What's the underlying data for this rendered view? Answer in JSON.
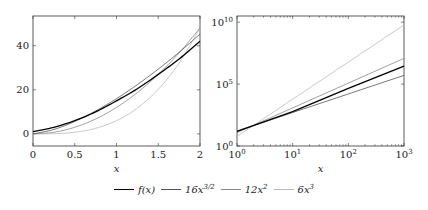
{
  "chart_data": [
    {
      "type": "line",
      "title": "",
      "xlabel": "x",
      "ylabel": "",
      "xscale": "linear",
      "yscale": "linear",
      "xlim": [
        0,
        2
      ],
      "ylim": [
        -5.5,
        53.5
      ],
      "xticks": [
        0,
        0.5,
        1,
        1.5,
        2
      ],
      "xtick_labels": [
        "0",
        "0.5",
        "1",
        "1.5",
        "2"
      ],
      "yticks": [
        0,
        20,
        40
      ],
      "ytick_labels": [
        "0",
        "20",
        "40"
      ],
      "grid": false,
      "x": [
        0,
        0.25,
        0.5,
        0.75,
        1,
        1.25,
        1.5,
        1.75,
        2
      ],
      "series": [
        {
          "name": "f(x)",
          "values": [
            1,
            3,
            6,
            10,
            15,
            20.5,
            27,
            34,
            42
          ]
        },
        {
          "name": "16x^{3/2}",
          "values": [
            0,
            2,
            5.66,
            10.39,
            16,
            22.36,
            29.39,
            37.04,
            45.25
          ]
        },
        {
          "name": "12x^2",
          "values": [
            0,
            0.75,
            3,
            6.75,
            12,
            18.75,
            27,
            36.75,
            48
          ]
        },
        {
          "name": "6x^3",
          "values": [
            0,
            0.09,
            0.75,
            2.53,
            6,
            11.72,
            20.25,
            32.16,
            48
          ]
        }
      ]
    },
    {
      "type": "line",
      "title": "",
      "xlabel": "x",
      "ylabel": "",
      "xscale": "log",
      "yscale": "log",
      "xlim": [
        1,
        1000
      ],
      "ylim": [
        1,
        31600000000.0
      ],
      "xticks": [
        1,
        10,
        100,
        1000
      ],
      "xtick_labels": [
        "10^0",
        "10^1",
        "10^2",
        "10^3"
      ],
      "yticks": [
        1,
        100000,
        10000000000
      ],
      "ytick_labels": [
        "10^0",
        "10^5",
        "10^10"
      ],
      "grid": false,
      "x": [
        1,
        10,
        100,
        1000
      ],
      "series": [
        {
          "name": "f(x)",
          "values": [
            15,
            600,
            45000,
            2800000
          ]
        },
        {
          "name": "16x^{3/2}",
          "values": [
            16,
            506,
            16000,
            506000
          ]
        },
        {
          "name": "12x^2",
          "values": [
            12,
            1200,
            120000,
            12000000
          ]
        },
        {
          "name": "6x^3",
          "values": [
            6,
            6000,
            6000000,
            6000000000
          ]
        }
      ]
    }
  ],
  "legend": {
    "position": "bottom",
    "items": [
      {
        "label": "f(x)",
        "color": "#000000",
        "width": 1.4
      },
      {
        "label": "16x",
        "sup": "3/2",
        "color": "#555555",
        "width": 0.8
      },
      {
        "label": "12x",
        "sup": "2",
        "color": "#888888",
        "width": 0.8
      },
      {
        "label": "6x",
        "sup": "3",
        "color": "#bbbbbb",
        "width": 0.8
      }
    ]
  },
  "colors": {
    "f": "#000000",
    "s16": "#555555",
    "s12": "#888888",
    "s6": "#bbbbbb",
    "axis": "#333333"
  }
}
